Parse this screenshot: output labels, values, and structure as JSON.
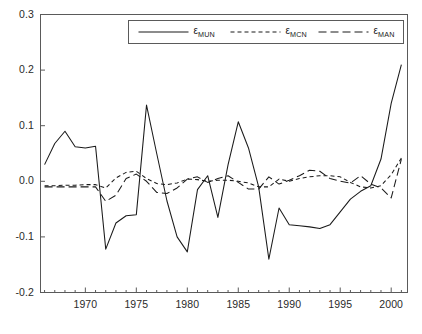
{
  "chart_data": {
    "type": "line",
    "title": "",
    "subtitle": "",
    "xlabel": "",
    "ylabel": "",
    "xlim": [
      1965.6,
      2001.6
    ],
    "ylim": [
      -0.2,
      0.3
    ],
    "grid": false,
    "legend_position": "top-center",
    "y_ticks": [
      "0.3",
      "0.2",
      "0.1",
      "0.0",
      "-0.1",
      "-0.2"
    ],
    "y_tick_values": [
      0.3,
      0.2,
      0.1,
      0.0,
      -0.1,
      -0.2
    ],
    "x_ticks": [
      "1970",
      "1975",
      "1980",
      "1985",
      "1990",
      "1995",
      "2000"
    ],
    "x_tick_values": [
      1970,
      1975,
      1980,
      1985,
      1990,
      1995,
      2000
    ],
    "x_minor_step": 1,
    "x": [
      1966,
      1967,
      1968,
      1969,
      1970,
      1971,
      1972,
      1973,
      1974,
      1975,
      1976,
      1977,
      1978,
      1979,
      1980,
      1981,
      1982,
      1983,
      1984,
      1985,
      1986,
      1987,
      1988,
      1989,
      1990,
      1991,
      1992,
      1993,
      1994,
      1995,
      1996,
      1997,
      1998,
      1999,
      2000,
      2001
    ],
    "series": [
      {
        "name": "ε_MUN",
        "label_base": "ε",
        "label_sub": "MUN",
        "style": "solid",
        "color": "#1a1a1a",
        "values": [
          0.03,
          0.068,
          0.09,
          0.062,
          0.06,
          0.063,
          -0.122,
          -0.075,
          -0.062,
          -0.06,
          0.137,
          0.05,
          -0.035,
          -0.1,
          -0.127,
          -0.015,
          0.01,
          -0.065,
          0.03,
          0.107,
          0.06,
          -0.01,
          -0.14,
          -0.048,
          -0.078,
          -0.08,
          -0.082,
          -0.085,
          -0.078,
          -0.055,
          -0.032,
          -0.018,
          -0.008,
          0.04,
          0.14,
          0.21
        ]
      },
      {
        "name": "ε_MCN",
        "label_base": "ε",
        "label_sub": "MCN",
        "style": "dashed",
        "color": "#1a1a1a",
        "values": [
          -0.008,
          -0.008,
          -0.007,
          -0.007,
          -0.006,
          -0.006,
          -0.012,
          0.006,
          0.016,
          0.018,
          0.005,
          -0.004,
          -0.006,
          -0.003,
          0.004,
          0.003,
          0.0,
          0.002,
          0.002,
          0.0,
          -0.003,
          -0.01,
          -0.01,
          0.004,
          0.0,
          0.005,
          0.008,
          0.01,
          0.01,
          0.008,
          -0.002,
          -0.01,
          -0.012,
          -0.008,
          0.012,
          0.042
        ]
      },
      {
        "name": "ε_MAN",
        "label_base": "ε",
        "label_sub": "MAN",
        "style": "longdash",
        "color": "#1a1a1a",
        "values": [
          -0.01,
          -0.01,
          -0.01,
          -0.01,
          -0.01,
          -0.01,
          -0.036,
          -0.025,
          0.005,
          0.013,
          0.0,
          -0.02,
          -0.022,
          -0.012,
          0.004,
          0.008,
          -0.002,
          0.005,
          0.01,
          -0.002,
          -0.014,
          -0.014,
          0.008,
          -0.005,
          0.002,
          0.01,
          0.02,
          0.018,
          0.005,
          0.0,
          -0.003,
          0.01,
          -0.005,
          -0.012,
          -0.03,
          0.04
        ]
      }
    ]
  },
  "legend": {
    "entries": [
      {
        "base": "ε",
        "sub": "MUN"
      },
      {
        "base": "ε",
        "sub": "MCN"
      },
      {
        "base": "ε",
        "sub": "MAN"
      }
    ]
  }
}
